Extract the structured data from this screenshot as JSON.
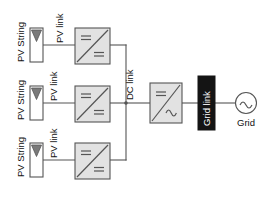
{
  "diagram": {
    "colors": {
      "stroke": "#555555",
      "converter_fill": "#e2e2e2",
      "pv_box_fill": "#ffffff",
      "triangle_fill": "#7a7a7a",
      "grid_link_fill": "#141414",
      "grid_link_text": "#ffffff",
      "text": "#111111",
      "background": "#ffffff"
    },
    "strings": [
      {
        "id": "string-1",
        "pv_string_label": "PV String",
        "pv_link_label": "PV link",
        "converter_label": "DC/DC converter",
        "converter_input_symbol": "=",
        "converter_output_symbol": "="
      },
      {
        "id": "string-2",
        "pv_string_label": "PV String",
        "pv_link_label": "PV link",
        "converter_label": "DC/DC converter",
        "converter_input_symbol": "=",
        "converter_output_symbol": "="
      },
      {
        "id": "string-3",
        "pv_string_label": "PV String",
        "pv_link_label": "PV link",
        "converter_label": "DC/DC converter",
        "converter_input_symbol": "=",
        "converter_output_symbol": "="
      }
    ],
    "dc_link": {
      "label": "DC link"
    },
    "inverter": {
      "label": "DC/AC inverter",
      "input_symbol": "=",
      "output_symbol": "~"
    },
    "grid_link": {
      "label": "Grid link"
    },
    "grid": {
      "label": "Grid",
      "symbol": "~"
    }
  }
}
